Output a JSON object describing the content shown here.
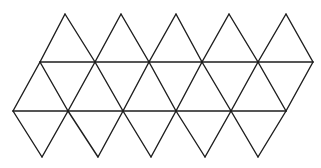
{
  "figure": {
    "stroke_color": "#1e1e1e",
    "background": "#ffffff",
    "triangle_count": 20,
    "rows": {
      "top_peaks": [
        [
          65,
          14
        ],
        [
          121,
          14
        ],
        [
          176,
          14
        ],
        [
          229,
          14
        ],
        [
          286,
          14
        ]
      ],
      "upper_line": [
        [
          40,
          62
        ],
        [
          95,
          62
        ],
        [
          149,
          62
        ],
        [
          202,
          62
        ],
        [
          258,
          62
        ],
        [
          313,
          62
        ]
      ],
      "middle_line": [
        [
          13,
          111
        ],
        [
          68,
          111
        ],
        [
          123,
          111
        ],
        [
          176,
          111
        ],
        [
          231,
          111
        ],
        [
          286,
          111
        ]
      ],
      "bottom_points": [
        [
          42,
          157
        ],
        [
          98,
          157
        ],
        [
          151,
          157
        ],
        [
          205,
          157
        ],
        [
          258,
          157
        ]
      ]
    }
  }
}
